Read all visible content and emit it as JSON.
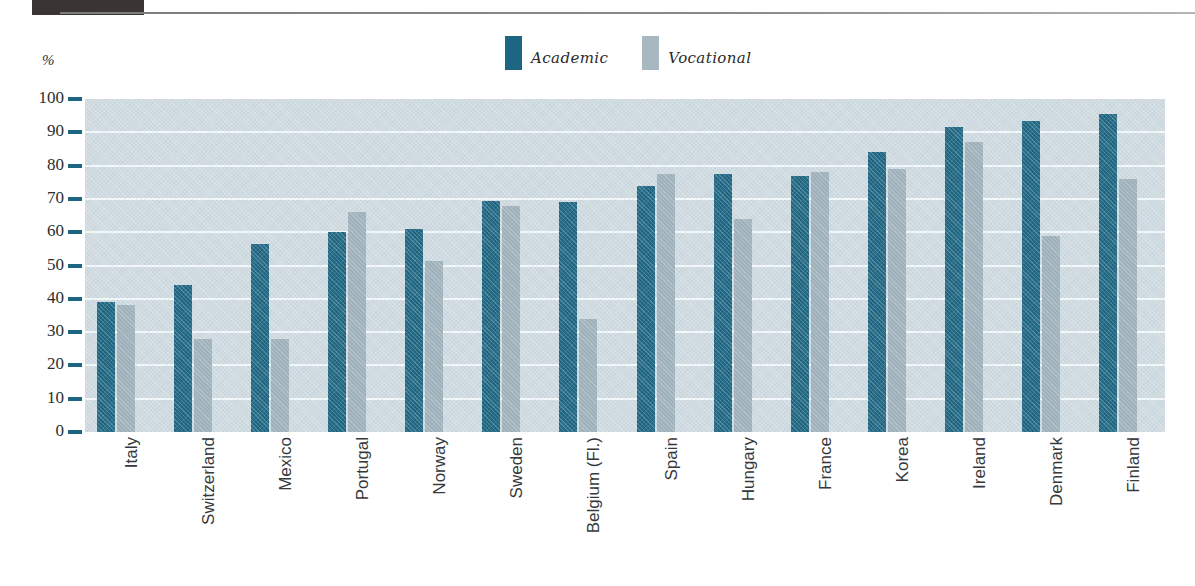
{
  "header": {
    "block_label": "",
    "rule": "horizontal-rule"
  },
  "axis": {
    "unit_label": "%",
    "y_ticks": [
      "100",
      "90",
      "80",
      "70",
      "60",
      "50",
      "40",
      "30",
      "20",
      "10",
      "0"
    ]
  },
  "legend": {
    "items": [
      {
        "label": "Academic",
        "color": "#1d6581"
      },
      {
        "label": "Vocational",
        "color": "#9fb2bb"
      }
    ]
  },
  "colors": {
    "academic": "#1d6581",
    "vocational": "#9fb2bb",
    "plot_background": "#cfdbe1",
    "gridline": "#f4f9fb",
    "tick": "#1d6581",
    "text": "#2d2d2d",
    "header_block": "#3a3533"
  },
  "chart_data": {
    "type": "bar",
    "title": "",
    "subtitle": "",
    "xlabel": "",
    "ylabel": "%",
    "ylim": [
      0,
      100
    ],
    "y_tick_step": 10,
    "grid": true,
    "legend_position": "top-center",
    "orientation": "vertical-grouped",
    "categories": [
      "Italy",
      "Switzerland",
      "Mexico",
      "Portugal",
      "Norway",
      "Sweden",
      "Belgium (Fl.)",
      "Spain",
      "Hungary",
      "France",
      "Korea",
      "Ireland",
      "Denmark",
      "Finland"
    ],
    "series": [
      {
        "name": "Academic",
        "color": "#1d6581",
        "values": [
          39,
          44,
          56.5,
          60,
          61,
          69.5,
          69,
          74,
          77.5,
          77,
          84,
          91.5,
          93.5,
          95.5
        ]
      },
      {
        "name": "Vocational",
        "color": "#9fb2bb",
        "values": [
          38,
          28,
          28,
          66,
          51.5,
          68,
          34,
          77.5,
          64,
          78,
          79,
          87,
          59,
          76
        ]
      }
    ]
  }
}
